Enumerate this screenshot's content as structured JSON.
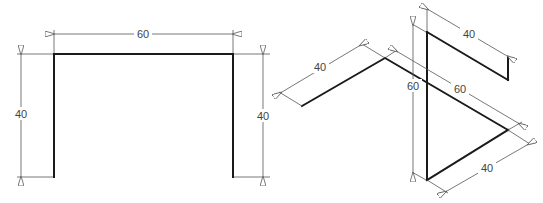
{
  "figures": [
    {
      "name": "orthographic-front-view",
      "dimensions": {
        "top_width": "60",
        "left_height": "40",
        "right_height": "40"
      }
    },
    {
      "name": "isometric-view",
      "dimensions": {
        "left_arm": "40",
        "upper_arm": "40",
        "vertical_height": "60",
        "long_diagonal": "60",
        "bottom_arm": "40"
      }
    }
  ],
  "colors": {
    "object_line": "#1a1a1a",
    "dimension_line": "#555555",
    "background": "#ffffff"
  }
}
